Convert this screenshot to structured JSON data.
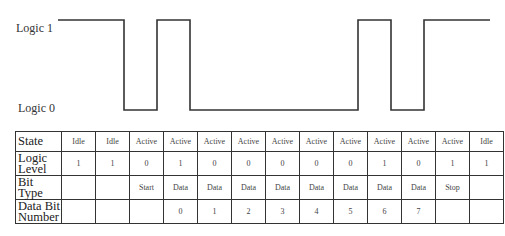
{
  "labels": {
    "logic1": "Logic 1",
    "logic0": "Logic 0"
  },
  "colors": {
    "line": "#333333",
    "border": "#333333",
    "background": "#ffffff"
  },
  "waveform": {
    "high_y": 20,
    "low_y": 110,
    "start_x": 58,
    "end_x": 490,
    "points": "58,20 124,20 124,110 157,110 157,20 190,20 190,110 358,110 358,20 391,20 391,110 424,110 424,20 490,20"
  },
  "table": {
    "row_headers": [
      [
        "State"
      ],
      [
        "Logic",
        "Level"
      ],
      [
        "Bit",
        "Type"
      ],
      [
        "Data Bit",
        "Number"
      ]
    ],
    "state": [
      "Idle",
      "Idle",
      "Active",
      "Active",
      "Active",
      "Active",
      "Active",
      "Active",
      "Active",
      "Active",
      "Active",
      "Active",
      "Idle"
    ],
    "logic": [
      "1",
      "1",
      "0",
      "1",
      "0",
      "0",
      "0",
      "0",
      "0",
      "1",
      "0",
      "1",
      "1"
    ],
    "bittype": [
      "",
      "",
      "Start",
      "Data",
      "Data",
      "Data",
      "Data",
      "Data",
      "Data",
      "Data",
      "Data",
      "Stop",
      ""
    ],
    "bitnum": [
      "",
      "",
      "",
      "0",
      "1",
      "2",
      "3",
      "4",
      "5",
      "6",
      "7",
      "",
      ""
    ]
  }
}
